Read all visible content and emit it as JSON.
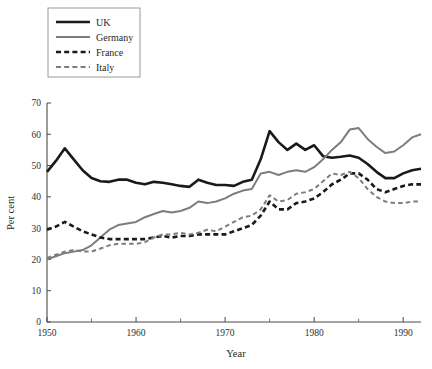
{
  "chart_data": {
    "type": "line",
    "title": "",
    "xlabel": "Year",
    "ylabel": "Per cent",
    "xlim": [
      1950,
      1992
    ],
    "ylim": [
      0,
      70
    ],
    "grid": false,
    "legend_position": "top-left",
    "x_ticks": [
      1950,
      1960,
      1970,
      1980,
      1990
    ],
    "x_tick_labels": [
      "1950",
      "1960",
      "1970",
      "1980",
      "1990"
    ],
    "x_minor_ticks": [
      1955,
      1965,
      1975,
      1985
    ],
    "y_ticks": [
      0,
      10,
      20,
      30,
      40,
      50,
      60,
      70
    ],
    "y_tick_labels": [
      "0",
      "10",
      "20",
      "30",
      "40",
      "50",
      "60",
      "70"
    ],
    "x": [
      1950,
      1951,
      1952,
      1953,
      1954,
      1955,
      1956,
      1957,
      1958,
      1959,
      1960,
      1961,
      1962,
      1963,
      1964,
      1965,
      1966,
      1967,
      1968,
      1969,
      1970,
      1971,
      1972,
      1973,
      1974,
      1975,
      1976,
      1977,
      1978,
      1979,
      1980,
      1981,
      1982,
      1983,
      1984,
      1985,
      1986,
      1987,
      1988,
      1989,
      1990,
      1991,
      1992
    ],
    "series": [
      {
        "name": "UK",
        "color": "#1a1a1a",
        "style": "solid",
        "width": 2.6,
        "values": [
          48.0,
          51.5,
          55.5,
          52.0,
          48.5,
          46.0,
          45.0,
          44.8,
          45.5,
          45.5,
          44.5,
          44.0,
          44.8,
          44.5,
          44.0,
          43.5,
          43.2,
          45.5,
          44.5,
          43.8,
          43.8,
          43.5,
          44.8,
          45.5,
          52.0,
          61.0,
          57.5,
          55.0,
          57.0,
          55.0,
          56.5,
          53.0,
          52.5,
          52.8,
          53.2,
          52.5,
          50.5,
          48.0,
          46.0,
          46.0,
          47.5,
          48.5,
          49.0
        ]
      },
      {
        "name": "Germany",
        "color": "#7d7d7d",
        "style": "solid",
        "width": 2.0,
        "values": [
          20.0,
          21.0,
          22.0,
          22.5,
          23.0,
          24.5,
          27.0,
          29.5,
          31.0,
          31.5,
          32.0,
          33.5,
          34.5,
          35.5,
          35.0,
          35.5,
          36.5,
          38.5,
          38.0,
          38.5,
          39.5,
          41.0,
          42.0,
          42.5,
          47.5,
          48.0,
          47.0,
          48.0,
          48.5,
          48.0,
          49.5,
          52.0,
          55.0,
          57.5,
          61.5,
          62.0,
          58.5,
          56.0,
          54.0,
          54.5,
          56.5,
          59.0,
          60.0
        ]
      },
      {
        "name": "France",
        "color": "#1a1a1a",
        "style": "dashed",
        "width": 2.6,
        "values": [
          29.5,
          30.5,
          32.0,
          30.5,
          29.0,
          28.0,
          27.0,
          26.5,
          26.5,
          26.5,
          26.5,
          26.5,
          27.0,
          27.5,
          27.0,
          27.5,
          27.5,
          28.0,
          28.0,
          28.0,
          28.0,
          29.0,
          30.0,
          31.0,
          34.0,
          38.5,
          36.0,
          36.0,
          38.0,
          38.5,
          39.5,
          41.5,
          44.0,
          45.5,
          47.5,
          47.5,
          45.5,
          42.5,
          41.5,
          42.5,
          43.5,
          44.0,
          44.0
        ]
      },
      {
        "name": "Italy",
        "color": "#7d7d7d",
        "style": "dashed",
        "width": 2.0,
        "values": [
          20.5,
          21.5,
          22.5,
          23.0,
          22.5,
          22.5,
          23.5,
          24.5,
          25.0,
          25.0,
          25.0,
          25.5,
          27.0,
          28.0,
          28.0,
          28.5,
          28.0,
          28.5,
          29.5,
          29.0,
          30.5,
          32.0,
          33.5,
          34.0,
          36.0,
          40.5,
          38.5,
          39.0,
          41.0,
          41.5,
          42.5,
          45.0,
          47.5,
          47.0,
          48.0,
          46.0,
          42.5,
          40.0,
          38.5,
          38.0,
          38.0,
          38.5,
          38.5
        ]
      }
    ]
  },
  "legend": {
    "items": [
      {
        "label": "UK"
      },
      {
        "label": "Germany"
      },
      {
        "label": "France"
      },
      {
        "label": "Italy"
      }
    ]
  }
}
